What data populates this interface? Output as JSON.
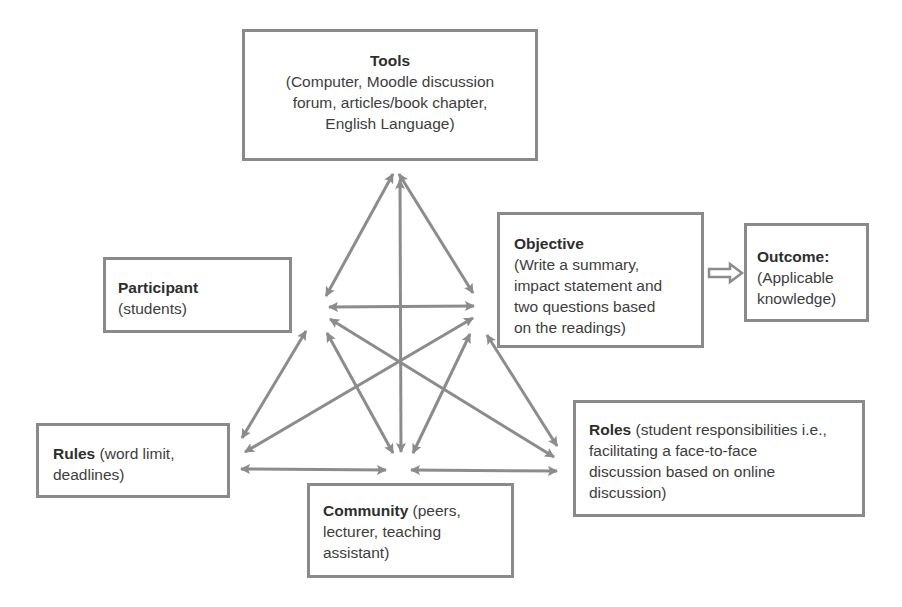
{
  "diagram": {
    "type": "activity-theory-framework",
    "colors": {
      "arrow": "#8c8c8c",
      "box_border": "#8a8a8a",
      "text": "#3d3d3d",
      "background": "#ffffff"
    },
    "nodes": {
      "tools": {
        "title": "Tools",
        "line1": "(Computer, Moodle discussion",
        "line2": "forum, articles/book chapter,",
        "line3": "English Language)"
      },
      "objective": {
        "title": "Objective",
        "line1": "(Write a summary,",
        "line2": "impact statement and",
        "line3": "two questions based",
        "line4": "on the readings)"
      },
      "outcome": {
        "title": "Outcome:",
        "line1": "(Applicable",
        "line2": "knowledge)"
      },
      "participant": {
        "title": "Participant",
        "line1": "(students)"
      },
      "rules": {
        "title": "Rules",
        "line1": " (word limit,",
        "line2": "deadlines)"
      },
      "community": {
        "title": "Community",
        "line1": " (peers,",
        "line2": "lecturer, teaching",
        "line3": "assistant)"
      },
      "roles": {
        "title": "Roles",
        "line1": " (student responsibilities i.e.,",
        "line2": "facilitating a face-to-face",
        "line3": "discussion based on online",
        "line4": "discussion)"
      }
    },
    "edges": [
      {
        "from": "tools",
        "to": "participant",
        "type": "bidirectional"
      },
      {
        "from": "tools",
        "to": "objective",
        "type": "bidirectional"
      },
      {
        "from": "tools",
        "to": "community",
        "type": "bidirectional"
      },
      {
        "from": "participant",
        "to": "objective",
        "type": "bidirectional"
      },
      {
        "from": "participant",
        "to": "rules",
        "type": "bidirectional"
      },
      {
        "from": "participant",
        "to": "community",
        "type": "bidirectional"
      },
      {
        "from": "participant",
        "to": "roles",
        "type": "bidirectional"
      },
      {
        "from": "objective",
        "to": "rules",
        "type": "bidirectional"
      },
      {
        "from": "objective",
        "to": "community",
        "type": "bidirectional"
      },
      {
        "from": "objective",
        "to": "roles",
        "type": "bidirectional"
      },
      {
        "from": "rules",
        "to": "community",
        "type": "bidirectional"
      },
      {
        "from": "community",
        "to": "roles",
        "type": "bidirectional"
      },
      {
        "from": "objective",
        "to": "outcome",
        "type": "hollow-arrow"
      }
    ]
  }
}
